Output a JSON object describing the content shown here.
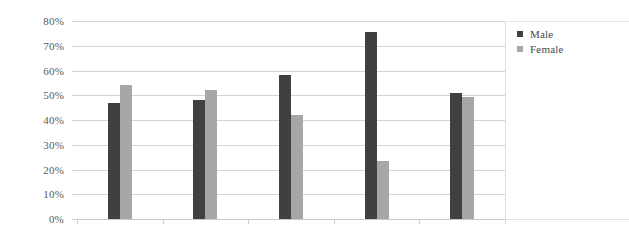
{
  "chart_data": {
    "type": "bar",
    "title": "",
    "subtitle": "",
    "xlabel": "",
    "ylabel": "",
    "categories": [
      "",
      "",
      "",
      "",
      ""
    ],
    "series": [
      {
        "name": "Male",
        "color": "#404040",
        "values": [
          47,
          48,
          58,
          75.5,
          51
        ]
      },
      {
        "name": "Female",
        "color": "#a6a6a6",
        "values": [
          54,
          52,
          42,
          23.5,
          49.5
        ]
      }
    ],
    "ylim": [
      0,
      80
    ],
    "ytick_values": [
      80,
      70,
      60,
      50,
      40,
      30,
      20,
      10,
      0
    ],
    "ytick_labels": [
      "80%",
      "70%",
      "60%",
      "50%",
      "40%",
      "30%",
      "20%",
      "10%",
      "0%"
    ],
    "grid": true,
    "grid_axis": "y",
    "legend_position": "right",
    "value_format": "percent"
  },
  "legend": {
    "entries": [
      {
        "label": "Male",
        "swatch": "legend-swatch-male"
      },
      {
        "label": "Female",
        "swatch": "legend-swatch-female"
      }
    ]
  }
}
